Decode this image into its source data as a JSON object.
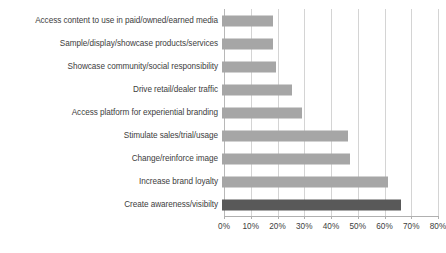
{
  "chart_data": {
    "type": "bar",
    "orientation": "horizontal",
    "title": "",
    "subtitle": "",
    "xlabel": "",
    "ylabel": "",
    "xlim": [
      0,
      80
    ],
    "xtick_labels": [
      "0%",
      "10%",
      "20%",
      "30%",
      "40%",
      "50%",
      "60%",
      "70%",
      "80%"
    ],
    "xtick_values": [
      0,
      10,
      20,
      30,
      40,
      50,
      60,
      70,
      80
    ],
    "grid": "vertical",
    "legend": "none",
    "value_unit": "%",
    "categories": [
      "Access content to use in paid/owned/earned media",
      "Sample/display/showcase products/services",
      "Showcase community/social responsibility",
      "Drive retail/dealer traffic",
      "Access platform for experiential branding",
      "Stimulate sales/trial/usage",
      "Change/reinforce image",
      "Increase brand loyalty",
      "Create awareness/visibilty"
    ],
    "values": [
      19,
      19,
      20,
      26,
      30,
      47,
      48,
      62,
      67
    ],
    "bars": [
      {
        "label": "Access content to use in paid/owned/earned media",
        "value": 19,
        "highlight": false
      },
      {
        "label": "Sample/display/showcase products/services",
        "value": 19,
        "highlight": false
      },
      {
        "label": "Showcase community/social responsibility",
        "value": 20,
        "highlight": false
      },
      {
        "label": "Drive retail/dealer traffic",
        "value": 26,
        "highlight": false
      },
      {
        "label": "Access platform for experiential branding",
        "value": 30,
        "highlight": false
      },
      {
        "label": "Stimulate sales/trial/usage",
        "value": 47,
        "highlight": false
      },
      {
        "label": "Change/reinforce image",
        "value": 48,
        "highlight": false
      },
      {
        "label": "Increase brand loyalty",
        "value": 62,
        "highlight": false
      },
      {
        "label": "Create awareness/visibilty",
        "value": 67,
        "highlight": true
      }
    ],
    "colors": {
      "bar": "#a6a6a6",
      "bar_highlight": "#595959",
      "gridline": "#d4d4d4",
      "axis": "#b0b0b0",
      "text": "#3d3d3d",
      "background": "#ffffff"
    }
  }
}
